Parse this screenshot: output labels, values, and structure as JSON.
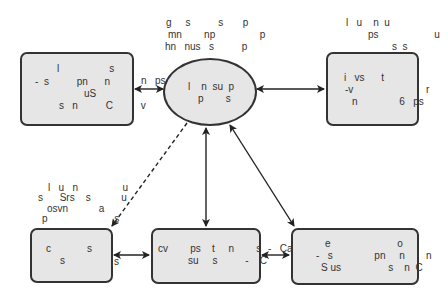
{
  "diagram": {
    "colors": {
      "node_fill": "#e6e6e6",
      "node_border": "#333333",
      "edge": "#222222",
      "text": "#333333"
    },
    "center_node": {
      "shape": "ellipse",
      "lines": [
        "l    n  su  p",
        "p        s"
      ],
      "caption_above": [
        "g     s          s       p",
        "mn        np                p",
        "hn   nus   s          p"
      ]
    },
    "top_left_node": {
      "lines": [
        "l                  s",
        "-  s          pn      n",
        "uS",
        "s   n          C          v"
      ],
      "edge_label": "n   ps"
    },
    "top_right_node": {
      "lines": [
        "i   vs      t",
        "-v",
        "n               6   ps"
      ],
      "caption_above": [
        "l   u    n  u",
        "ps                    u",
        "s  s"
      ],
      "side_label": "r"
    },
    "bottom_left_node": {
      "lines": [
        "c             s",
        "s"
      ],
      "caption_above": [
        "l   u   n                u",
        "s      Srs    s           u",
        "osvn           a",
        "p                        s"
      ],
      "edge_label": "s"
    },
    "bottom_center_node": {
      "lines": [
        "cv        ps    t     n        s",
        "su     s          -    C"
      ],
      "edge_label": "-   Ca"
    },
    "bottom_right_node": {
      "lines": [
        "e                        o",
        "-   s               pn     n",
        "S us                 s    n  C"
      ],
      "side_label": "n"
    },
    "edges": [
      {
        "from": "top_left_node",
        "to": "center_node",
        "style": "solid",
        "arrows": "both"
      },
      {
        "from": "center_node",
        "to": "top_right_node",
        "style": "solid",
        "arrows": "both"
      },
      {
        "from": "center_node",
        "to": "bottom_left_node",
        "style": "dashed",
        "arrows": "end",
        "label": [
          "u",
          "u",
          "s"
        ]
      },
      {
        "from": "center_node",
        "to": "bottom_center_node",
        "style": "solid",
        "arrows": "both"
      },
      {
        "from": "center_node",
        "to": "bottom_right_node",
        "style": "solid",
        "arrows": "both"
      },
      {
        "from": "bottom_left_node",
        "to": "bottom_center_node",
        "style": "solid",
        "arrows": "both"
      },
      {
        "from": "bottom_center_node",
        "to": "bottom_right_node",
        "style": "solid",
        "arrows": "both"
      }
    ]
  }
}
